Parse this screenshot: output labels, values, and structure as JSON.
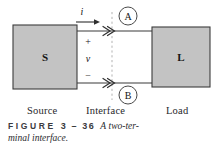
{
  "figure": {
    "blocks": {
      "source": {
        "symbol": "S",
        "name": "source-block"
      },
      "load": {
        "symbol": "L",
        "name": "load-block"
      }
    },
    "terminals": [
      {
        "id": "A",
        "label": "A"
      },
      {
        "id": "B",
        "label": "B"
      }
    ],
    "annotations": {
      "current": "i",
      "plus": "+",
      "voltage": "v",
      "minus": "−"
    },
    "sections": {
      "source": "Source",
      "interface": "Interface",
      "load": "Load"
    },
    "caption": {
      "kicker": "FIGURE",
      "number": "3 – 36",
      "article": "A",
      "text_line1": "two-ter-",
      "text_line2": "minal interface."
    },
    "colors": {
      "block_fill": "#c3c3c3",
      "block_stroke": "#3c3c3c",
      "wire": "#3a3a3a",
      "interface_dash": "#b0b0b0",
      "background": "#ffffff",
      "text": "#1a1a1a"
    }
  }
}
